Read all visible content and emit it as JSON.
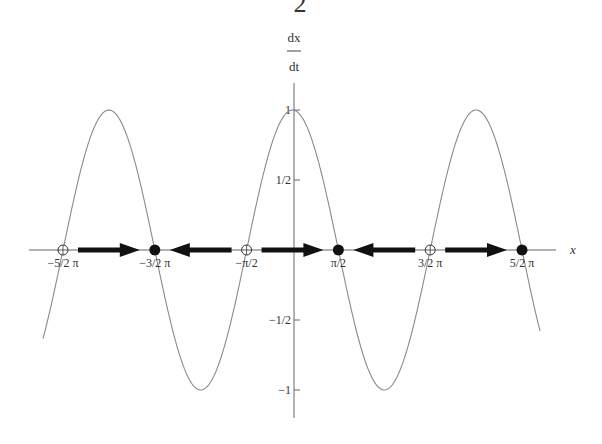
{
  "header_fragment": "2",
  "caption": "",
  "chart_data": {
    "type": "line",
    "title": "",
    "function": "dx/dt = cos(x)",
    "xlabel": "x",
    "ylabel_num": "dx",
    "ylabel_den": "dt",
    "xlim": [
      -8.3,
      8.7
    ],
    "ylim": [
      -1.2,
      1.2
    ],
    "grid": false,
    "legend": null,
    "x_ticks": [
      {
        "value": -7.854,
        "label": "−5/2 π"
      },
      {
        "value": -4.712,
        "label": "−3/2 π"
      },
      {
        "value": -1.571,
        "label": "−π/2"
      },
      {
        "value": 1.571,
        "label": "π/2"
      },
      {
        "value": 4.712,
        "label": "3/2 π"
      },
      {
        "value": 7.854,
        "label": "5/2 π"
      }
    ],
    "y_ticks": [
      {
        "value": 1,
        "label": "1"
      },
      {
        "value": 0.5,
        "label": "1/2"
      },
      {
        "value": -0.5,
        "label": "−1/2"
      },
      {
        "value": -1,
        "label": "−1"
      }
    ],
    "series": [
      {
        "name": "cos(x)",
        "x_range": [
          -9.0,
          9.0
        ],
        "extrema": [
          {
            "x": -6.283,
            "y": 1
          },
          {
            "x": -3.142,
            "y": -1
          },
          {
            "x": 0,
            "y": 1
          },
          {
            "x": 3.142,
            "y": -1
          },
          {
            "x": 6.283,
            "y": 1
          }
        ]
      }
    ],
    "fixed_points": [
      {
        "x": -7.854,
        "label": "−5/2 π",
        "type": "unstable",
        "marker": "open-circle"
      },
      {
        "x": -4.712,
        "label": "−3/2 π",
        "type": "stable",
        "marker": "filled-circle"
      },
      {
        "x": -1.571,
        "label": "−π/2",
        "type": "unstable",
        "marker": "open-circle"
      },
      {
        "x": 1.571,
        "label": "π/2",
        "type": "stable",
        "marker": "filled-circle"
      },
      {
        "x": 4.712,
        "label": "3/2 π",
        "type": "unstable",
        "marker": "open-circle"
      },
      {
        "x": 7.854,
        "label": "5/2 π",
        "type": "stable",
        "marker": "filled-circle"
      }
    ],
    "flow_arrows": [
      {
        "from": -7.854,
        "to": -4.712,
        "direction": "right"
      },
      {
        "from": -1.571,
        "to": -4.712,
        "direction": "left"
      },
      {
        "from": -1.571,
        "to": 1.571,
        "direction": "right"
      },
      {
        "from": 4.712,
        "to": 1.571,
        "direction": "left"
      },
      {
        "from": 4.712,
        "to": 7.854,
        "direction": "right"
      }
    ]
  },
  "colors": {
    "curve": "#8a8a8a",
    "axis": "#555555",
    "arrow": "#111111",
    "text": "#333333"
  }
}
